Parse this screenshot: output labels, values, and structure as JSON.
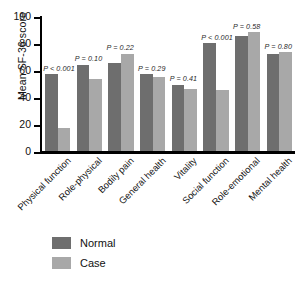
{
  "chart_data": {
    "type": "bar",
    "title": "",
    "xlabel": "",
    "ylabel": "Mean SF-36 score",
    "ylim": [
      0,
      100
    ],
    "yticks": [
      0,
      20,
      40,
      60,
      80,
      100
    ],
    "ytick_labels": [
      "0",
      "20",
      "40",
      "60",
      "80",
      "100"
    ],
    "grid": false,
    "legend_position": "bottom-left",
    "categories": [
      "Physical function",
      "Role-physical",
      "Bodily pain",
      "General health",
      "Vitality",
      "Social function",
      "Role-emotional",
      "Mental health"
    ],
    "series": [
      {
        "name": "Normal",
        "color": "#6e6e6e",
        "values": [
          57,
          64,
          65,
          57,
          49,
          80,
          85,
          72
        ]
      },
      {
        "name": "Case",
        "color": "#a8a8a8",
        "values": [
          17,
          53,
          72,
          55,
          46,
          45,
          88,
          73
        ]
      }
    ],
    "annotations": [
      "P < 0.001",
      "P = 0.10",
      "P = 0.22",
      "P = 0.29",
      "P = 0.41",
      "P < 0.001",
      "P = 0.58",
      "P = 0.80"
    ]
  },
  "legend": {
    "items": [
      {
        "label": "Normal",
        "color": "#6e6e6e"
      },
      {
        "label": "Case",
        "color": "#a8a8a8"
      }
    ]
  }
}
